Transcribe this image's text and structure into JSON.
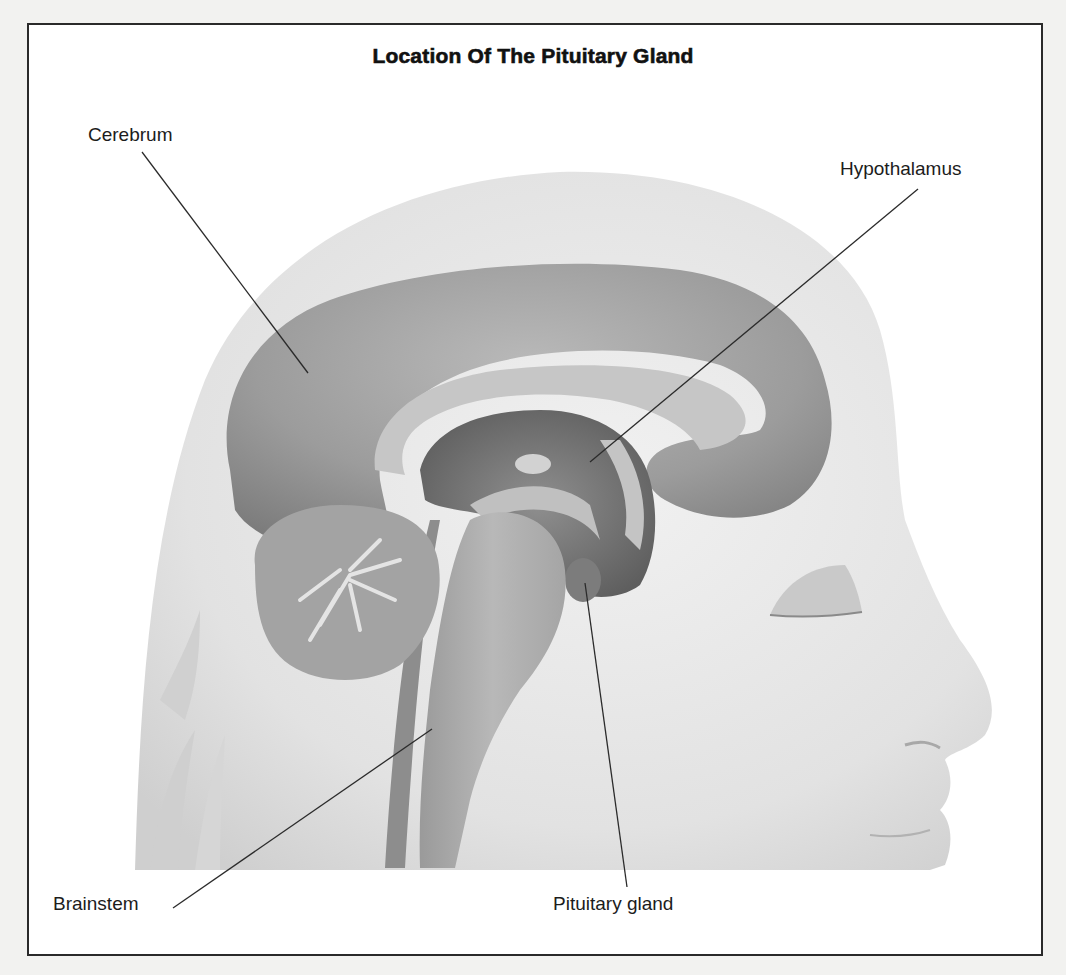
{
  "figure": {
    "title": "Location Of The Pituitary Gland",
    "colors": {
      "frame_border": "#2a2a2a",
      "background": "#ffffff",
      "head": "#dedede",
      "brain": "#9a9a9a",
      "brain_dark": "#6e6e6e",
      "ventricle": "#c4c4c4",
      "leader_line": "#2b2b2b",
      "text": "#1c1c1c"
    },
    "labels": [
      {
        "id": "cerebrum",
        "text": "Cerebrum",
        "label_pos": [
          88,
          124
        ],
        "line": [
          [
            142,
            152
          ],
          [
            308,
            373
          ]
        ]
      },
      {
        "id": "hypothalamus",
        "text": "Hypothalamus",
        "label_pos": [
          840,
          158
        ],
        "line": [
          [
            918,
            189
          ],
          [
            590,
            462
          ]
        ]
      },
      {
        "id": "brainstem",
        "text": "Brainstem",
        "label_pos": [
          53,
          893
        ],
        "line": [
          [
            173,
            908
          ],
          [
            432,
            729
          ]
        ]
      },
      {
        "id": "pituitary-gland",
        "text": "Pituitary gland",
        "label_pos": [
          553,
          893
        ],
        "line": [
          [
            627,
            887
          ],
          [
            585,
            583
          ]
        ]
      }
    ]
  }
}
